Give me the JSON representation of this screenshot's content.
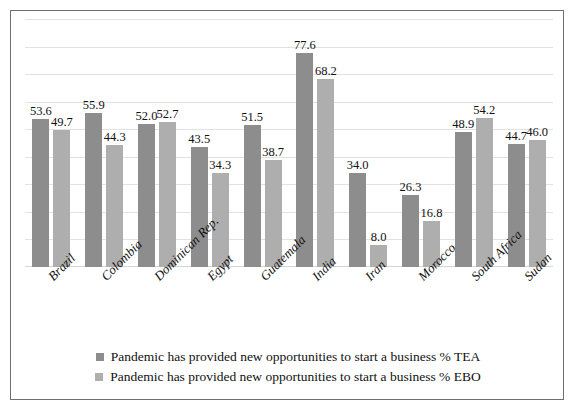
{
  "chart_data": {
    "type": "bar",
    "title": "",
    "xlabel": "",
    "ylabel": "",
    "ylim": [
      0,
      90
    ],
    "grid": true,
    "gridlines": [
      10,
      20,
      30,
      40,
      50,
      60,
      70,
      80,
      90
    ],
    "legend_position": "bottom",
    "categories": [
      "Brazil",
      "Colombia",
      "Dominican Rep.",
      "Egypt",
      "Guatemala",
      "India",
      "Iran",
      "Morocco",
      "South Africa",
      "Sudan"
    ],
    "series": [
      {
        "name": "Pandemic has provided new opportunities to start a business % TEA",
        "color": "#8d8d8d",
        "values": [
          53.6,
          55.9,
          52.0,
          43.5,
          51.5,
          77.6,
          34.0,
          26.3,
          48.9,
          44.7
        ],
        "labels": [
          "53.6",
          "55.9",
          "52.0",
          "43.5",
          "51.5",
          "77.6",
          "34.0",
          "26.3",
          "48.9",
          "44.7"
        ]
      },
      {
        "name": "Pandemic has provided new opportunities to start a business % EBO",
        "color": "#aeaeae",
        "values": [
          49.7,
          44.3,
          52.7,
          34.3,
          38.7,
          68.2,
          8.0,
          16.8,
          54.2,
          46.0
        ],
        "labels": [
          "49.7",
          "44.3",
          "52.7",
          "34.3",
          "38.7",
          "68.2",
          "8.0",
          "16.8",
          "54.2",
          "46.0"
        ]
      }
    ]
  },
  "legend": {
    "items": [
      {
        "label": "Pandemic has provided new opportunities to start a business % TEA",
        "color": "#8d8d8d"
      },
      {
        "label": "Pandemic has provided new opportunities to start a business % EBO",
        "color": "#aeaeae"
      }
    ]
  }
}
